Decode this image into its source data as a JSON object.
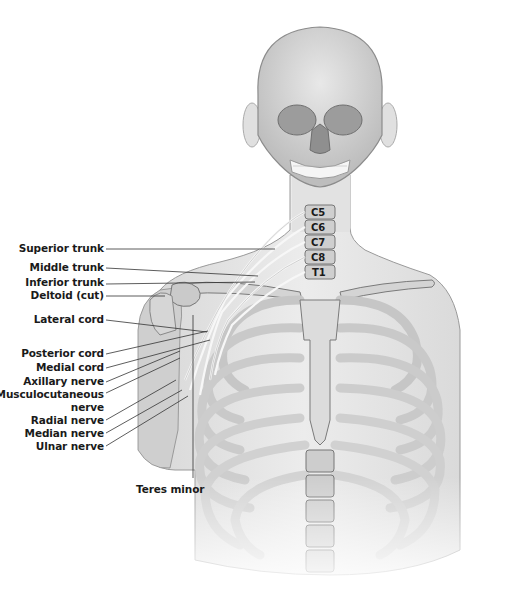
{
  "figure": {
    "colors": {
      "background": "#ffffff",
      "skin": "#e6e6e6",
      "skin_outline": "#9a9a9a",
      "bone": "#d2d2d2",
      "bone_shadow": "#8c8c8c",
      "nerve": "#f4f4f4",
      "label_text": "#1a1a1a",
      "leader_line": "#333333"
    }
  },
  "vertebra_labels": [
    {
      "id": "c5",
      "text": "C5",
      "x": 311,
      "y": 213
    },
    {
      "id": "c6",
      "text": "C6",
      "x": 311,
      "y": 228
    },
    {
      "id": "c7",
      "text": "C7",
      "x": 311,
      "y": 242
    },
    {
      "id": "c8",
      "text": "C8",
      "x": 311,
      "y": 257
    },
    {
      "id": "t1",
      "text": "T1",
      "x": 311,
      "y": 271
    }
  ],
  "labels": [
    {
      "id": "superior-trunk",
      "text": "Superior trunk",
      "x": 32,
      "y": 242,
      "line": [
        106,
        249,
        275,
        249
      ]
    },
    {
      "id": "middle-trunk",
      "text": "Middle trunk",
      "x": 39,
      "y": 261,
      "line": [
        106,
        268,
        258,
        276
      ]
    },
    {
      "id": "inferior-trunk",
      "text": "Inferior trunk",
      "x": 36,
      "y": 276,
      "line": [
        106,
        284,
        255,
        282
      ]
    },
    {
      "id": "deltoid-cut",
      "text": "Deltoid (cut)",
      "x": 41,
      "y": 289,
      "line": [
        106,
        296,
        165,
        296
      ]
    },
    {
      "id": "lateral-cord",
      "text": "Lateral cord",
      "x": 44,
      "y": 313,
      "line": [
        106,
        320,
        207,
        332
      ]
    },
    {
      "id": "posterior-cord",
      "text": "Posterior cord",
      "x": 33,
      "y": 347,
      "line": [
        106,
        354,
        208,
        331
      ]
    },
    {
      "id": "medial-cord",
      "text": "Medial cord",
      "x": 45,
      "y": 361,
      "line": [
        106,
        368,
        210,
        340
      ]
    },
    {
      "id": "axillary-nerve",
      "text": "Axillary nerve",
      "x": 36,
      "y": 375,
      "line": [
        106,
        382,
        180,
        351
      ]
    },
    {
      "id": "musculocutaneous-nerve",
      "text": "Musculocutaneous",
      "text2": "nerve",
      "x": 11,
      "y": 388,
      "line": [
        106,
        393,
        180,
        358
      ]
    },
    {
      "id": "radial-nerve",
      "text": "Radial nerve",
      "x": 42,
      "y": 414,
      "line": [
        106,
        420,
        176,
        380
      ]
    },
    {
      "id": "median-nerve",
      "text": "Median nerve",
      "x": 36,
      "y": 427,
      "line": [
        106,
        433,
        182,
        390
      ]
    },
    {
      "id": "ulnar-nerve",
      "text": "Ulnar nerve",
      "x": 47,
      "y": 440,
      "line": [
        106,
        446,
        188,
        396
      ]
    },
    {
      "id": "teres-minor",
      "text": "Teres minor",
      "x": 136,
      "y": 483,
      "line": [
        193,
        480,
        193,
        315
      ]
    }
  ]
}
